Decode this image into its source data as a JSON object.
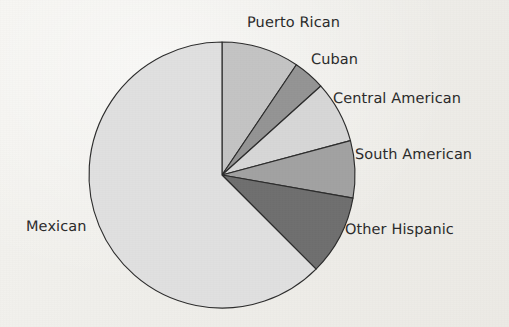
{
  "figure": {
    "background_color": "#f2f1ed",
    "outline_color": "#2c2c2c"
  },
  "chart_data": {
    "type": "pie",
    "title": "",
    "subtitle": "",
    "xlabel": "",
    "ylabel": "",
    "legend_position": "none",
    "labels_position": "outside-callout",
    "grid": false,
    "start_angle_deg": 0,
    "direction": "clockwise",
    "center_px": [
      222,
      175
    ],
    "radius_px": 133,
    "categories": [
      "Puerto Rican",
      "Cuban",
      "Central American",
      "South American",
      "Other Hispanic",
      "Mexican"
    ],
    "values": [
      9.4,
      3.9,
      7.5,
      6.9,
      9.7,
      62.6
    ],
    "value_unit": "percent",
    "slices": [
      {
        "label": "Puerto Rican",
        "value": 9.4,
        "start_deg": 0,
        "end_deg": 34,
        "color": "#c4c4c4"
      },
      {
        "label": "Cuban",
        "value": 3.9,
        "start_deg": 34,
        "end_deg": 48,
        "color": "#949494"
      },
      {
        "label": "Central American",
        "value": 7.5,
        "start_deg": 48,
        "end_deg": 75,
        "color": "#d7d7d7"
      },
      {
        "label": "South American",
        "value": 6.9,
        "start_deg": 75,
        "end_deg": 100,
        "color": "#a2a2a2"
      },
      {
        "label": "Other Hispanic",
        "value": 9.7,
        "start_deg": 100,
        "end_deg": 135,
        "color": "#6f6f6f"
      },
      {
        "label": "Mexican",
        "value": 62.6,
        "start_deg": 135,
        "end_deg": 360,
        "color": "#e0e0e0"
      }
    ]
  },
  "labels": {
    "puerto_rican": "Puerto Rican",
    "cuban": "Cuban",
    "central_american": "Central American",
    "south_american": "South American",
    "other_hispanic": "Other Hispanic",
    "mexican": "Mexican"
  }
}
